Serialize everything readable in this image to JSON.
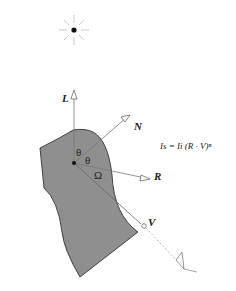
{
  "diagram": {
    "labels": {
      "light": "L",
      "normal": "N",
      "reflect": "R",
      "view": "V",
      "theta1": "θ",
      "theta2": "θ",
      "omega": "Ω"
    },
    "formula": "Is = Ii (R · V)ⁿ",
    "colors": {
      "surface": "#8f8f8f",
      "stroke": "#333333",
      "vector": "#888888"
    }
  }
}
